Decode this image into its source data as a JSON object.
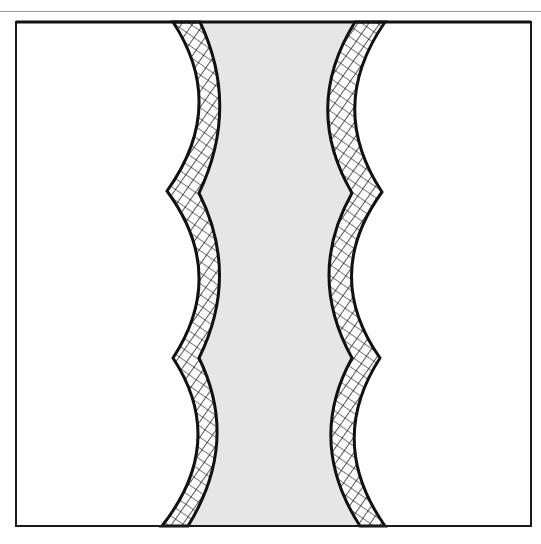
{
  "figure": {
    "colors": {
      "background": "#ffffff",
      "channel_fill": "#e6e6e6",
      "band_ink": "#111111",
      "frame": "#1a1a1a",
      "top_rule": "#9a9a9a"
    },
    "frame": {
      "x": 16,
      "y": 22,
      "width": 515,
      "height": 504
    },
    "left_wall": {
      "outer_points": [
        [
          173,
          22
        ],
        [
          167,
          191
        ],
        [
          173,
          358
        ],
        [
          162,
          526
        ]
      ],
      "arc_bulge_x": 212,
      "band_width": 24
    },
    "right_wall": {
      "outer_points": [
        [
          385,
          22
        ],
        [
          382,
          192
        ],
        [
          380,
          358
        ],
        [
          385,
          526
        ]
      ],
      "arc_bulge_x": 342,
      "band_width": 26
    },
    "segments": 3,
    "labels": []
  }
}
